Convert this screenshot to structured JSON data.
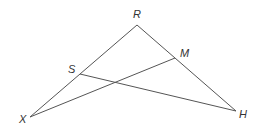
{
  "diagram": {
    "type": "geometry-triangle",
    "line_color": "#555555",
    "points": {
      "R": {
        "label": "R",
        "x": 137,
        "y": 25,
        "lx": 133,
        "ly": 18
      },
      "X": {
        "label": "X",
        "x": 30,
        "y": 117,
        "lx": 19,
        "ly": 123
      },
      "H": {
        "label": "H",
        "x": 236,
        "y": 111,
        "lx": 239,
        "ly": 118
      },
      "S": {
        "label": "S",
        "x": 80,
        "y": 74,
        "lx": 68,
        "ly": 73
      },
      "M": {
        "label": "M",
        "x": 175,
        "y": 58,
        "lx": 180,
        "ly": 57
      }
    },
    "segments": [
      {
        "from": "R",
        "to": "X"
      },
      {
        "from": "R",
        "to": "H"
      },
      {
        "from": "S",
        "to": "H"
      },
      {
        "from": "X",
        "to": "M"
      }
    ]
  }
}
